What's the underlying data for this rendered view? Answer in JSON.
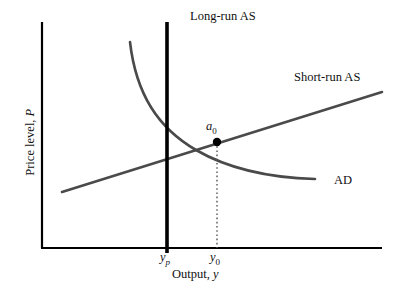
{
  "figure": {
    "title": "",
    "axes": {
      "x_title_prefix": "Output, ",
      "x_title_symbol": "y",
      "y_title_prefix": "Price level, ",
      "y_title_symbol": "P",
      "origin_x": 42,
      "origin_y": 248,
      "x_end": 382,
      "y_top": 22,
      "axis_color": "#000000"
    },
    "x_ticks": [
      {
        "symbol": "y",
        "subscript": "p",
        "subscript_italic": true,
        "x": 167
      },
      {
        "symbol": "y",
        "subscript": "0",
        "subscript_italic": false,
        "x": 217
      }
    ],
    "curves": [
      {
        "name": "long-run-as",
        "label": "Long-run AS",
        "label_x": 190,
        "label_y": 10,
        "color": "#000000",
        "width": 3.6,
        "type": "vertical-line",
        "x": 167,
        "y_from": 22,
        "y_to": 253
      },
      {
        "name": "short-run-as",
        "label": "Short-run AS",
        "label_x": 294,
        "label_y": 71,
        "color": "#4a4a4a",
        "width": 2.6,
        "type": "line",
        "points": "62,192 382,92"
      },
      {
        "name": "aggregate-demand",
        "label": "AD",
        "label_x": 334,
        "label_y": 174,
        "color": "#4a4a4a",
        "width": 2.6,
        "type": "curve",
        "path": "M 130,42 C 136,94 158,128 196,150 C 234,172 278,178 315,179"
      }
    ],
    "equilibrium": {
      "label": "a",
      "subscript": "0",
      "x": 217,
      "y": 142,
      "dot_radius": 4.2,
      "dot_color": "#000000",
      "dropline_color": "#555555",
      "dropline_style": "dotted",
      "dropline_to_y": 248
    },
    "chart_data": {
      "type": "line",
      "title": "",
      "xlabel": "Output, y",
      "ylabel": "Price level, P",
      "xlim": [
        42,
        382
      ],
      "ylim": [
        22,
        248
      ],
      "grid": false,
      "legend": "inline-labels",
      "series": [
        {
          "name": "Long-run AS",
          "shape": "vertical",
          "x": [
            167,
            167
          ],
          "y": [
            22,
            253
          ]
        },
        {
          "name": "Short-run AS",
          "shape": "upward-sloping-line",
          "x": [
            62,
            382
          ],
          "y": [
            192,
            92
          ]
        },
        {
          "name": "AD",
          "shape": "downward-sloping-convex-curve",
          "x": [
            130,
            160,
            196,
            240,
            280,
            315
          ],
          "y": [
            42,
            110,
            150,
            170,
            177,
            179
          ]
        }
      ],
      "annotations": [
        {
          "text": "a0",
          "x": 217,
          "y": 142,
          "note": "equilibrium point"
        },
        {
          "text": "yp",
          "x": 167,
          "y": 248,
          "note": "potential output tick"
        },
        {
          "text": "y0",
          "x": 217,
          "y": 248,
          "note": "current output tick"
        }
      ]
    }
  }
}
